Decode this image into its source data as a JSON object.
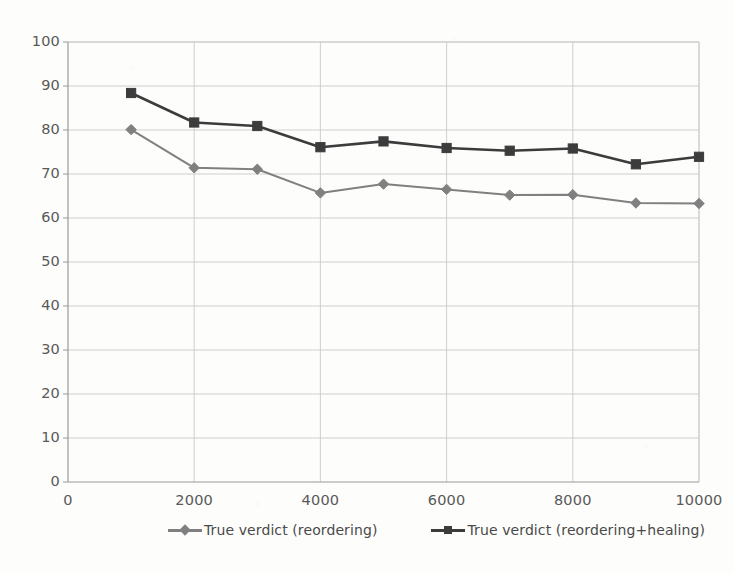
{
  "chart_data": {
    "type": "line",
    "title": "",
    "subtitle": "",
    "xlabel": "",
    "ylabel": "",
    "xlim": [
      0,
      10000
    ],
    "ylim": [
      0,
      100
    ],
    "x": [
      1000,
      2000,
      3000,
      4000,
      5000,
      6000,
      7000,
      8000,
      9000,
      10000
    ],
    "x_ticks": [
      "0",
      "2000",
      "4000",
      "6000",
      "8000",
      "10000"
    ],
    "x_tick_values": [
      0,
      2000,
      4000,
      6000,
      8000,
      10000
    ],
    "y_ticks": [
      "0",
      "10",
      "20",
      "30",
      "40",
      "50",
      "60",
      "70",
      "80",
      "90",
      "100"
    ],
    "y_tick_values": [
      0,
      10,
      20,
      30,
      40,
      50,
      60,
      70,
      80,
      90,
      100
    ],
    "grid": true,
    "legend_position": "bottom",
    "series": [
      {
        "name": "True verdict (reordering)",
        "marker": "diamond",
        "color": "#808080",
        "values": [
          80.1,
          71.4,
          71.1,
          65.7,
          67.7,
          66.5,
          65.2,
          65.3,
          63.4,
          63.3
        ]
      },
      {
        "name": "True verdict (reordering+healing)",
        "marker": "square",
        "color": "#3c3c3c",
        "values": [
          88.4,
          81.7,
          80.9,
          76.1,
          77.4,
          75.9,
          75.3,
          75.8,
          72.2,
          73.9
        ]
      }
    ]
  },
  "colors": {
    "grid": "#c9c9c9",
    "axis": "#9a9a9a",
    "tick_text": "#595959",
    "legend_text": "#4a4a4a",
    "series_1": "#808080",
    "series_2": "#3c3c3c",
    "background": "#fdfdfc"
  }
}
